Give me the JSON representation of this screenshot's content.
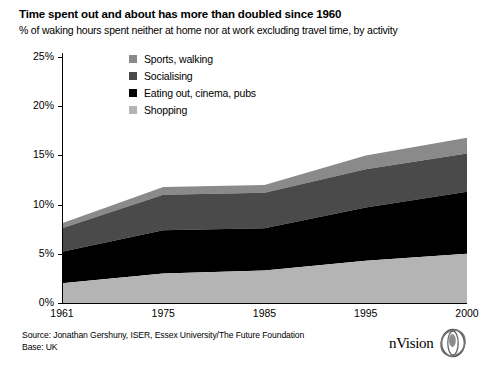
{
  "header": {
    "title": "Time spent out and about has more than doubled since 1960",
    "subtitle": "% of waking hours spent neither at home nor at work excluding travel time, by activity"
  },
  "footer": {
    "source": "Source: Jonathan Gershuny, ISER, Essex University/The Future Foundation",
    "base": "Base: UK",
    "credit": "17385: Graphics from  nVision  for Ian Yeoman",
    "logo_text": "nVision",
    "logo_icon": "nvision-eye-logo"
  },
  "colors": {
    "shopping": "#b4b4b4",
    "eating": "#000000",
    "socialising": "#4a4a4a",
    "sports": "#8a8a8a",
    "axis": "#000000",
    "background": "#ffffff"
  },
  "chart_data": {
    "type": "area",
    "stacked": true,
    "title": "Time spent out and about has more than doubled since 1960",
    "subtitle": "% of waking hours spent neither at home nor at work excluding travel time, by activity",
    "xlabel": "",
    "ylabel": "% of waking hours",
    "x": [
      "1961",
      "1975",
      "1985",
      "1995",
      "2000"
    ],
    "categories": [
      "1961",
      "1975",
      "1985",
      "1995",
      "2000"
    ],
    "ylim": [
      0,
      25
    ],
    "yticks": [
      0,
      5,
      10,
      15,
      20,
      25
    ],
    "ytick_labels": [
      "0%",
      "5%",
      "10%",
      "15%",
      "20%",
      "25%"
    ],
    "grid": false,
    "legend_position": "inside-top-left",
    "stack_order_bottom_to_top": [
      "Shopping",
      "Eating out, cinema, pubs",
      "Socialising",
      "Sports, walking"
    ],
    "series": [
      {
        "name": "Shopping",
        "color": "#b4b4b4",
        "values": [
          2.0,
          3.0,
          3.3,
          4.3,
          5.0
        ]
      },
      {
        "name": "Eating out, cinema, pubs",
        "color": "#000000",
        "values": [
          3.2,
          4.4,
          4.3,
          5.4,
          6.3
        ]
      },
      {
        "name": "Socialising",
        "color": "#4a4a4a",
        "values": [
          2.4,
          3.6,
          3.6,
          3.9,
          3.9
        ]
      },
      {
        "name": "Sports, walking",
        "color": "#8a8a8a",
        "values": [
          0.5,
          0.8,
          0.8,
          1.4,
          1.6
        ]
      }
    ],
    "cumulative_tops": {
      "Shopping": [
        2.0,
        3.0,
        3.3,
        4.3,
        5.0
      ],
      "Eating out, cinema, pubs": [
        5.2,
        7.4,
        7.6,
        9.7,
        11.3
      ],
      "Socialising": [
        7.6,
        11.0,
        11.2,
        13.6,
        15.2
      ],
      "Sports, walking": [
        8.1,
        11.8,
        12.0,
        15.0,
        16.8
      ]
    },
    "totals": [
      8.1,
      11.8,
      12.0,
      15.0,
      16.8
    ]
  },
  "legend": {
    "items": [
      {
        "label": "Sports, walking",
        "color": "#8a8a8a"
      },
      {
        "label": "Socialising",
        "color": "#4a4a4a"
      },
      {
        "label": "Eating out, cinema, pubs",
        "color": "#000000"
      },
      {
        "label": "Shopping",
        "color": "#b4b4b4"
      }
    ]
  }
}
